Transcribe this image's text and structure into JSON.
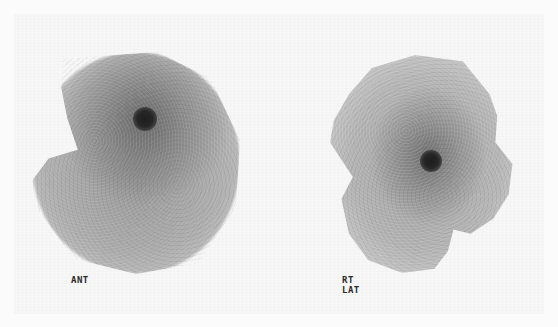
{
  "image": {
    "type": "nuclear-medicine-scintigraphy",
    "background_color": "#fbfbfb",
    "views": [
      {
        "label": "ANT",
        "hotspot": {
          "present": true,
          "color": "#1e1e1e"
        }
      },
      {
        "label": "RT LAT",
        "hotspot": {
          "present": true,
          "color": "#1c1c1c"
        }
      }
    ]
  }
}
